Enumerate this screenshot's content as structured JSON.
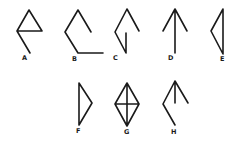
{
  "diagram": {
    "type": "figure-options",
    "stroke_color": "#1a1a1a",
    "background": "#ffffff",
    "figures": [
      {
        "label": "A",
        "shape": "triangle with tail line extending down from left vertex",
        "path": "M30 53 L17 31 L29 10 L42 31 L17 31",
        "label_pos": [
          22,
          60
        ]
      },
      {
        "label": "B",
        "shape": "open zigzag: short descending segment, peak, left vertex, down to bottom then horizontal right",
        "path": "M91 32 L78 10 L65 32 L78 53 L103 53",
        "label_pos": [
          72,
          61
        ]
      },
      {
        "label": "C",
        "shape": "open diamond with vertical segment on lower right",
        "path": "M139 31 L127 9 L115 32 L126 53 L126 33",
        "label_pos": [
          113,
          60
        ]
      },
      {
        "label": "D",
        "shape": "upward arrow",
        "path": "M163 31 L175 9 L187 31 M175 9 L175 53",
        "label_pos": [
          168,
          60
        ]
      },
      {
        "label": "E",
        "shape": "left-pointing triangle",
        "path": "M223 9 L211 31 L223 54 Z",
        "label_pos": [
          220,
          61
        ]
      },
      {
        "label": "F",
        "shape": "right-pointing triangle",
        "path": "M79 83 L92 103 L79 125 Z",
        "label_pos": [
          76,
          133
        ]
      },
      {
        "label": "G",
        "shape": "diamond with vertical and horizontal cross lines",
        "path": "M127 83 L139 104 L127 126 L115 104 Z M127 83 L127 126 M115 104 L139 104",
        "label_pos": [
          124,
          134
        ]
      },
      {
        "label": "H",
        "shape": "arrow-like figure with stem, right arm and zigzag left arm",
        "path": "M188 103 L175 81 L163 104 L175 125 M175 81 L175 103",
        "label_pos": [
          171,
          134
        ]
      }
    ]
  }
}
